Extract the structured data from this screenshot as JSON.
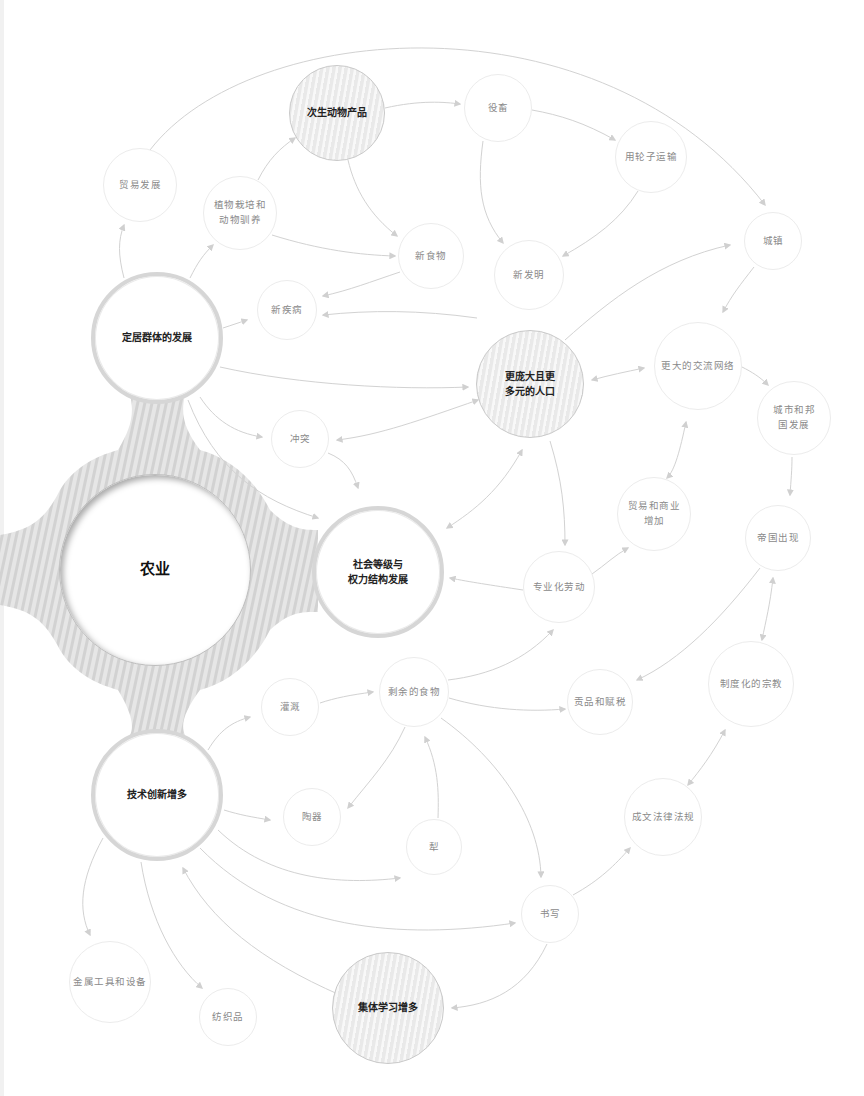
{
  "diagram": {
    "type": "concept-map",
    "central": {
      "id": "agriculture",
      "label": "农业"
    },
    "nodes": [
      {
        "id": "agriculture",
        "lines": [
          "农业"
        ],
        "x": 155,
        "y": 570,
        "r": 96,
        "style": "hub"
      },
      {
        "id": "settled",
        "lines": [
          "定居群体的发展"
        ],
        "x": 157,
        "y": 338,
        "r": 66,
        "style": "major"
      },
      {
        "id": "hierarchy",
        "lines": [
          "社会等级与",
          "权力结构发展"
        ],
        "x": 378,
        "y": 572,
        "r": 66,
        "style": "major"
      },
      {
        "id": "tech",
        "lines": [
          "技术创新增多"
        ],
        "x": 157,
        "y": 795,
        "r": 66,
        "style": "major"
      },
      {
        "id": "secondary",
        "lines": [
          "次生动物产品"
        ],
        "x": 337,
        "y": 113,
        "r": 48,
        "style": "striped"
      },
      {
        "id": "population",
        "lines": [
          "更庞大且更",
          "多元的人口"
        ],
        "x": 530,
        "y": 384,
        "r": 54,
        "style": "striped"
      },
      {
        "id": "learning",
        "lines": [
          "集体学习增多"
        ],
        "x": 388,
        "y": 1008,
        "r": 56,
        "style": "striped"
      },
      {
        "id": "trade",
        "lines": [
          "贸易发展"
        ],
        "x": 140,
        "y": 185,
        "r": 37,
        "style": "plain"
      },
      {
        "id": "domestication",
        "lines": [
          "植物栽培和",
          "动物驯养"
        ],
        "x": 240,
        "y": 213,
        "r": 37,
        "style": "plain"
      },
      {
        "id": "draft",
        "lines": [
          "役畜"
        ],
        "x": 498,
        "y": 108,
        "r": 34,
        "style": "plain"
      },
      {
        "id": "wheel",
        "lines": [
          "用轮子运输"
        ],
        "x": 651,
        "y": 157,
        "r": 36,
        "style": "plain"
      },
      {
        "id": "newfood",
        "lines": [
          "新食物"
        ],
        "x": 431,
        "y": 256,
        "r": 33,
        "style": "plain"
      },
      {
        "id": "invention",
        "lines": [
          "新发明"
        ],
        "x": 529,
        "y": 275,
        "r": 35,
        "style": "plain"
      },
      {
        "id": "town",
        "lines": [
          "城镇"
        ],
        "x": 773,
        "y": 241,
        "r": 29,
        "style": "plain"
      },
      {
        "id": "disease",
        "lines": [
          "新疾病"
        ],
        "x": 287,
        "y": 310,
        "r": 30,
        "style": "plain"
      },
      {
        "id": "network",
        "lines": [
          "更大的交流网络"
        ],
        "x": 698,
        "y": 366,
        "r": 44,
        "style": "plain"
      },
      {
        "id": "citystate",
        "lines": [
          "城市和邦",
          "国发展"
        ],
        "x": 794,
        "y": 418,
        "r": 37,
        "style": "plain"
      },
      {
        "id": "conflict",
        "lines": [
          "冲突"
        ],
        "x": 300,
        "y": 439,
        "r": 29,
        "style": "plain"
      },
      {
        "id": "commerce",
        "lines": [
          "贸易和商业",
          "增加"
        ],
        "x": 654,
        "y": 514,
        "r": 37,
        "style": "plain"
      },
      {
        "id": "empire",
        "lines": [
          "帝国出现"
        ],
        "x": 778,
        "y": 538,
        "r": 33,
        "style": "plain"
      },
      {
        "id": "specialization",
        "lines": [
          "专业化劳动"
        ],
        "x": 559,
        "y": 587,
        "r": 36,
        "style": "plain"
      },
      {
        "id": "irrigation",
        "lines": [
          "灌溉"
        ],
        "x": 290,
        "y": 707,
        "r": 29,
        "style": "plain"
      },
      {
        "id": "surplus",
        "lines": [
          "剩余的食物"
        ],
        "x": 414,
        "y": 692,
        "r": 35,
        "style": "plain"
      },
      {
        "id": "tribute",
        "lines": [
          "贡品和赋税"
        ],
        "x": 600,
        "y": 702,
        "r": 33,
        "style": "plain"
      },
      {
        "id": "religion",
        "lines": [
          "制度化的宗教"
        ],
        "x": 751,
        "y": 684,
        "r": 43,
        "style": "plain"
      },
      {
        "id": "pottery",
        "lines": [
          "陶器"
        ],
        "x": 312,
        "y": 817,
        "r": 29,
        "style": "plain"
      },
      {
        "id": "plough",
        "lines": [
          "犁"
        ],
        "x": 434,
        "y": 847,
        "r": 28,
        "style": "plain"
      },
      {
        "id": "law",
        "lines": [
          "成文法律法规"
        ],
        "x": 663,
        "y": 817,
        "r": 39,
        "style": "plain"
      },
      {
        "id": "writing",
        "lines": [
          "书写"
        ],
        "x": 550,
        "y": 914,
        "r": 29,
        "style": "plain"
      },
      {
        "id": "metal",
        "lines": [
          "金属工具和设备"
        ],
        "x": 110,
        "y": 982,
        "r": 41,
        "style": "plain"
      },
      {
        "id": "textile",
        "lines": [
          "纺织品"
        ],
        "x": 228,
        "y": 1017,
        "r": 29,
        "style": "plain"
      }
    ],
    "edges": [
      {
        "path": "M124,278 C118,255 118,240 124,225",
        "end": true,
        "start": false
      },
      {
        "path": "M190,278 C198,262 203,255 213,245",
        "end": true,
        "start": false
      },
      {
        "path": "M258,180 C268,160 280,148 295,138",
        "end": true,
        "start": false
      },
      {
        "path": "M272,235 C320,250 360,255 395,256",
        "end": true,
        "start": false
      },
      {
        "path": "M150,150 C250,20 600,-10 765,205",
        "end": true,
        "start": false
      },
      {
        "path": "M385,108 C420,100 445,102 460,104",
        "end": true,
        "start": false
      },
      {
        "path": "M348,160 C355,190 370,215 397,236",
        "end": true,
        "start": false
      },
      {
        "path": "M532,110 C560,115 585,123 615,140",
        "end": true,
        "start": false
      },
      {
        "path": "M483,141 C477,185 480,215 503,243",
        "end": true,
        "start": false
      },
      {
        "path": "M638,191 C620,220 595,238 563,256",
        "end": true,
        "start": false
      },
      {
        "path": "M400,272 C370,282 350,290 323,296",
        "end": true,
        "start": false
      },
      {
        "path": "M223,328 C232,325 238,323 247,320",
        "end": true,
        "start": false
      },
      {
        "path": "M220,367 C300,385 400,390 468,387",
        "end": true,
        "start": false
      },
      {
        "path": "M200,397 C215,420 235,433 262,437",
        "end": true,
        "start": false
      },
      {
        "path": "M188,400 C215,470 260,500 318,518",
        "end": true,
        "start": false
      },
      {
        "path": "M328,453 C345,460 352,470 358,488",
        "end": true,
        "start": false
      },
      {
        "path": "M478,400 C420,420 380,435 337,440",
        "end": true,
        "start": true
      },
      {
        "path": "M565,340 C610,300 660,260 730,245",
        "end": true,
        "start": false
      },
      {
        "path": "M477,318 C420,310 370,310 323,315",
        "end": true,
        "start": false
      },
      {
        "path": "M592,380 C610,375 625,372 644,368",
        "end": true,
        "start": true
      },
      {
        "path": "M522,450 C500,490 475,510 447,528",
        "end": true,
        "start": true
      },
      {
        "path": "M550,441 C562,480 565,510 565,545",
        "end": true,
        "start": false
      },
      {
        "path": "M754,267 C740,285 732,295 723,312",
        "end": true,
        "start": false
      },
      {
        "path": "M742,367 C752,372 760,377 768,385",
        "end": true,
        "start": false
      },
      {
        "path": "M792,457 C792,470 791,480 790,495",
        "end": true,
        "start": false
      },
      {
        "path": "M686,422 C680,450 675,470 667,478",
        "end": true,
        "start": true
      },
      {
        "path": "M592,574 C605,565 615,555 628,548",
        "end": true,
        "start": false
      },
      {
        "path": "M523,590 C490,585 470,582 450,578",
        "end": true,
        "start": false
      },
      {
        "path": "M760,568 C720,620 680,660 637,680",
        "end": true,
        "start": false
      },
      {
        "path": "M773,578 C770,605 766,620 762,640",
        "end": true,
        "start": true
      },
      {
        "path": "M208,750 C220,730 232,722 250,717",
        "end": true,
        "start": false
      },
      {
        "path": "M320,703 C335,698 350,695 373,692",
        "end": true,
        "start": false
      },
      {
        "path": "M448,680 C490,675 525,660 553,630",
        "end": true,
        "start": false
      },
      {
        "path": "M449,698 C490,710 530,712 565,709",
        "end": true,
        "start": false
      },
      {
        "path": "M405,727 C390,760 370,780 348,808",
        "end": true,
        "start": false
      },
      {
        "path": "M438,818 C439,790 438,765 425,737",
        "end": true,
        "start": false
      },
      {
        "path": "M441,718 C500,760 540,820 541,877",
        "end": true,
        "start": false
      },
      {
        "path": "M224,810 C240,815 252,817 270,820",
        "end": true,
        "start": false
      },
      {
        "path": "M218,830 C270,880 340,885 400,878",
        "end": true,
        "start": false
      },
      {
        "path": "M200,848 C280,930 400,940 515,923",
        "end": true,
        "start": false
      },
      {
        "path": "M340,995 C260,960 210,920 183,868",
        "end": true,
        "start": false
      },
      {
        "path": "M103,838 C80,880 78,910 90,935",
        "end": true,
        "start": false
      },
      {
        "path": "M141,862 C150,920 175,965 202,988",
        "end": true,
        "start": false
      },
      {
        "path": "M573,895 C600,880 615,865 630,848",
        "end": true,
        "start": false
      },
      {
        "path": "M547,944 C525,990 490,1005 452,1008",
        "end": true,
        "start": false
      },
      {
        "path": "M688,785 C700,770 712,755 725,730",
        "end": true,
        "start": true
      }
    ],
    "colors": {
      "edge": "#d2d2d2",
      "arrow": "#d4d4d4",
      "ring_stripe_dark": "#cfcfcf",
      "ring_stripe_light": "#ececec",
      "major_text": "#222222",
      "minor_text": "#8a8a8a"
    }
  }
}
